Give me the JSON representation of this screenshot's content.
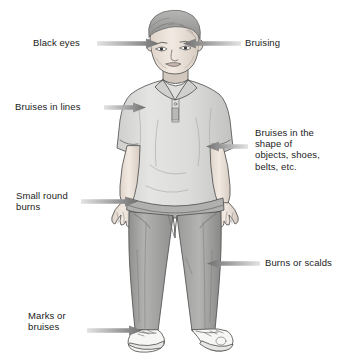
{
  "illustration": {
    "title": "Signs of physical abuse on a child",
    "subject": "standing boy wearing a short-sleeve polo shirt, long trousers and sneakers",
    "colors": {
      "background": "#ffffff",
      "ink": "#3a3a3a",
      "skin": "#efe7e0",
      "shirt": "#dcdcda",
      "shirt_shadow": "#c4c4c2",
      "pants": "#a9a9a7",
      "pants_shadow": "#8d8d8b",
      "shoe": "#f4f4f2",
      "hair": "#9b9b99",
      "arrow_dark": "#6f6f6f",
      "arrow_light": "#e3e3e3",
      "text": "#1b1b1b"
    }
  },
  "callouts": [
    {
      "id": "black-eyes",
      "label": "Black eyes",
      "side": "left",
      "text_x": 33,
      "text_y": 37,
      "arrow_x": 97,
      "arrow_y": 38,
      "arrow_w": 62,
      "points": "right",
      "target": "eyes"
    },
    {
      "id": "bruising",
      "label": "Bruising",
      "side": "right",
      "text_x": 245,
      "text_y": 37,
      "arrow_x": 183,
      "arrow_y": 38,
      "arrow_w": 58,
      "points": "left",
      "target": "head"
    },
    {
      "id": "bruises-in-lines",
      "label": "Bruises in lines",
      "side": "left",
      "text_x": 15,
      "text_y": 101,
      "arrow_x": 104,
      "arrow_y": 102,
      "arrow_w": 42,
      "points": "right",
      "target": "upper-arm"
    },
    {
      "id": "bruises-shape-of-objects",
      "label": "Bruises in the\nshape of\nobjects, shoes,\nbelts, etc.",
      "side": "right",
      "text_x": 255,
      "text_y": 127,
      "arrow_x": 206,
      "arrow_y": 141,
      "arrow_w": 42,
      "points": "left",
      "target": "torso-side"
    },
    {
      "id": "small-round-burns",
      "label": "Small round\nburns",
      "side": "left",
      "text_x": 16,
      "text_y": 190,
      "arrow_x": 81,
      "arrow_y": 196,
      "arrow_w": 57,
      "points": "right",
      "target": "hand"
    },
    {
      "id": "burns-or-scalds",
      "label": "Burns or scalds",
      "side": "right",
      "text_x": 265,
      "text_y": 257,
      "arrow_x": 207,
      "arrow_y": 258,
      "arrow_w": 53,
      "points": "left",
      "target": "lower-leg"
    },
    {
      "id": "marks-or-bruises",
      "label": "Marks or\nbruises",
      "side": "left",
      "text_x": 28,
      "text_y": 310,
      "arrow_x": 87,
      "arrow_y": 325,
      "arrow_w": 55,
      "points": "right",
      "target": "foot"
    }
  ]
}
